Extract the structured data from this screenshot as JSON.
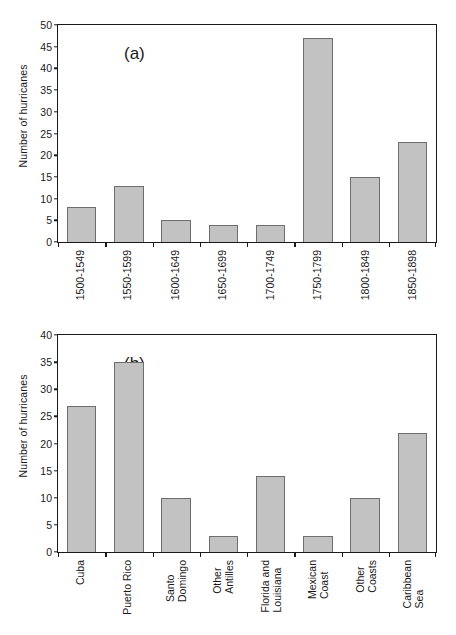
{
  "figure": {
    "background": "#ffffff",
    "bar_fill": "#c2c2c2",
    "bar_stroke": "#6e6e6e",
    "axis_color": "#1a1a1a"
  },
  "chart_data": [
    {
      "type": "bar",
      "panel_label": "(a)",
      "title": "",
      "xlabel": "",
      "ylabel": "Number of hurricanes",
      "ylim": [
        0,
        50
      ],
      "ytick_step": 5,
      "yticks": [
        0,
        5,
        10,
        15,
        20,
        25,
        30,
        35,
        40,
        45,
        50
      ],
      "grid": false,
      "legend": null,
      "categories": [
        "1500-1549",
        "1550-1599",
        "1600-1649",
        "1650-1699",
        "1700-1749",
        "1750-1799",
        "1800-1849",
        "1850-1898"
      ],
      "values": [
        8,
        13,
        5,
        4,
        4,
        47,
        15,
        23
      ]
    },
    {
      "type": "bar",
      "panel_label": "(b)",
      "title": "",
      "xlabel": "",
      "ylabel": "Number of hurricanes",
      "ylim": [
        0,
        40
      ],
      "ytick_step": 5,
      "yticks": [
        0,
        5,
        10,
        15,
        20,
        25,
        30,
        35,
        40
      ],
      "grid": false,
      "legend": null,
      "categories": [
        "Cuba",
        "Puerto Rico",
        "Santo\nDomingo",
        "Other\nAntilles",
        "Florida and\nLouisiana",
        "Mexican\nCoast",
        "Other\nCoasts",
        "Caribbean\nSea"
      ],
      "values": [
        27,
        35,
        10,
        3,
        14,
        3,
        10,
        22
      ]
    }
  ]
}
